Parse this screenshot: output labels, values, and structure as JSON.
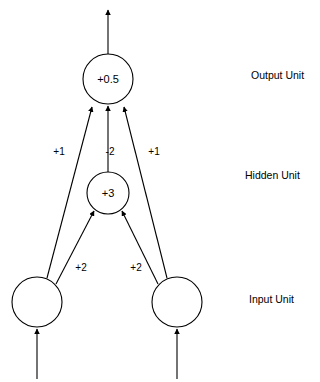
{
  "diagram": {
    "units": {
      "output": {
        "name": "output-unit",
        "value": "+0.5",
        "cx": 108,
        "cy": 79,
        "r": 25
      },
      "hidden": {
        "name": "hidden-unit",
        "value": "+3",
        "cx": 108,
        "cy": 193,
        "r": 21
      },
      "input_left": {
        "name": "input-unit-left",
        "value": "",
        "cx": 37,
        "cy": 302,
        "r": 25
      },
      "input_right": {
        "name": "input-unit-right",
        "value": "",
        "cx": 177,
        "cy": 302,
        "r": 25
      }
    },
    "weights": {
      "left_skip": "+1",
      "hidden_to_output": "-2",
      "right_skip": "+1",
      "left_to_hidden": "+2",
      "right_to_hidden": "+2"
    },
    "layer_labels": {
      "output": "Output Unit",
      "hidden": "Hidden Unit",
      "input": "Input Unit"
    },
    "colors": {
      "stroke": "#000000",
      "fill": "#ffffff",
      "text": "#000000"
    }
  }
}
